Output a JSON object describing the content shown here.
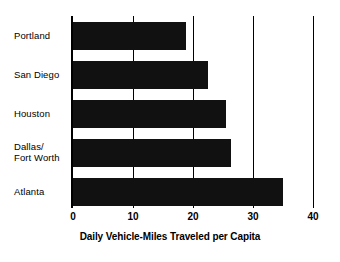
{
  "chart_data": {
    "type": "bar",
    "orientation": "horizontal",
    "title": "",
    "xlabel": "Daily Vehicle-Miles Traveled per Capita",
    "ylabel": "",
    "categories": [
      "Portland",
      "San Diego",
      "Houston",
      "Dallas/\nFort Worth",
      "Atlanta"
    ],
    "values": [
      18.8,
      22.5,
      25.5,
      26.3,
      35.0
    ],
    "xlim": [
      0,
      40
    ],
    "xticks": [
      0,
      10,
      20,
      30,
      40
    ],
    "xticklabels": [
      "0",
      "10",
      "20",
      "30",
      "40"
    ],
    "grid": true,
    "grid_axis": "x",
    "legend": false,
    "bar_color": "#111111",
    "background_color": "#ffffff",
    "axis_color": "#000000"
  },
  "labels": {
    "categories": [
      {
        "line1": "Portland",
        "line2": ""
      },
      {
        "line1": "San Diego",
        "line2": ""
      },
      {
        "line1": "Houston",
        "line2": ""
      },
      {
        "line1": "Dallas/",
        "line2": "Fort Worth"
      },
      {
        "line1": "Atlanta",
        "line2": ""
      }
    ]
  },
  "axis": {
    "x_title": "Daily Vehicle-Miles Traveled per Capita",
    "tick_0": "0",
    "tick_1": "10",
    "tick_2": "20",
    "tick_3": "30",
    "tick_4": "40"
  }
}
